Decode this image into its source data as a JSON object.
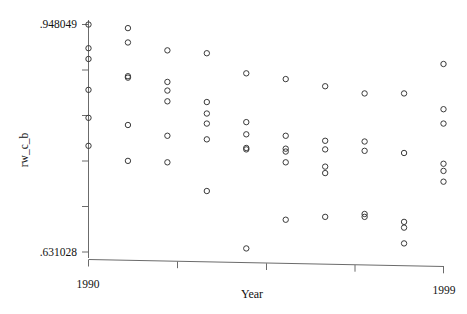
{
  "chart_data": {
    "type": "scatter",
    "title": "",
    "xlabel": "Year",
    "ylabel": "rw_c_b",
    "xlim": [
      1990,
      1999
    ],
    "ylim": [
      0.631028,
      0.948049
    ],
    "grid": false,
    "legend": null,
    "marker_style": "open-circle",
    "x_ticks": [
      {
        "value": 1990,
        "label": "1990"
      },
      {
        "value": 1993,
        "label": ""
      },
      {
        "value": 1996,
        "label": ""
      },
      {
        "value": 1999,
        "label": "1999"
      }
    ],
    "y_ticks": [
      {
        "value": 0.948049,
        "label": ".948049"
      },
      {
        "value": 0.884645,
        "label": ""
      },
      {
        "value": 0.821241,
        "label": ""
      },
      {
        "value": 0.757836,
        "label": ""
      },
      {
        "value": 0.694432,
        "label": ""
      },
      {
        "value": 0.631028,
        "label": ".631028"
      }
    ],
    "y_min_label": ".631028",
    "y_max_label": ".948049",
    "x_min_label": "1990",
    "x_max_label": "1999",
    "points": [
      {
        "x": 1990,
        "y": 0.948
      },
      {
        "x": 1990,
        "y": 0.915
      },
      {
        "x": 1990,
        "y": 0.9
      },
      {
        "x": 1990,
        "y": 0.857
      },
      {
        "x": 1990,
        "y": 0.818
      },
      {
        "x": 1990,
        "y": 0.779
      },
      {
        "x": 1991,
        "y": 0.943
      },
      {
        "x": 1991,
        "y": 0.923
      },
      {
        "x": 1991,
        "y": 0.876
      },
      {
        "x": 1991,
        "y": 0.874
      },
      {
        "x": 1991,
        "y": 0.808
      },
      {
        "x": 1991,
        "y": 0.758
      },
      {
        "x": 1992,
        "y": 0.912
      },
      {
        "x": 1992,
        "y": 0.868
      },
      {
        "x": 1992,
        "y": 0.856
      },
      {
        "x": 1992,
        "y": 0.841
      },
      {
        "x": 1992,
        "y": 0.793
      },
      {
        "x": 1992,
        "y": 0.756
      },
      {
        "x": 1993,
        "y": 0.908
      },
      {
        "x": 1993,
        "y": 0.84
      },
      {
        "x": 1993,
        "y": 0.824
      },
      {
        "x": 1993,
        "y": 0.81
      },
      {
        "x": 1993,
        "y": 0.788
      },
      {
        "x": 1993,
        "y": 0.716
      },
      {
        "x": 1994,
        "y": 0.88
      },
      {
        "x": 1994,
        "y": 0.812
      },
      {
        "x": 1994,
        "y": 0.795
      },
      {
        "x": 1994,
        "y": 0.776
      },
      {
        "x": 1994,
        "y": 0.774
      },
      {
        "x": 1994,
        "y": 0.636
      },
      {
        "x": 1995,
        "y": 0.872
      },
      {
        "x": 1995,
        "y": 0.793
      },
      {
        "x": 1995,
        "y": 0.775
      },
      {
        "x": 1995,
        "y": 0.771
      },
      {
        "x": 1995,
        "y": 0.756
      },
      {
        "x": 1995,
        "y": 0.676
      },
      {
        "x": 1996,
        "y": 0.862
      },
      {
        "x": 1996,
        "y": 0.786
      },
      {
        "x": 1996,
        "y": 0.774
      },
      {
        "x": 1996,
        "y": 0.75
      },
      {
        "x": 1996,
        "y": 0.741
      },
      {
        "x": 1996,
        "y": 0.68
      },
      {
        "x": 1997,
        "y": 0.852
      },
      {
        "x": 1997,
        "y": 0.785
      },
      {
        "x": 1997,
        "y": 0.772
      },
      {
        "x": 1997,
        "y": 0.684
      },
      {
        "x": 1997,
        "y": 0.68
      },
      {
        "x": 1998,
        "y": 0.852
      },
      {
        "x": 1998,
        "y": 0.769
      },
      {
        "x": 1998,
        "y": 0.673
      },
      {
        "x": 1998,
        "y": 0.665
      },
      {
        "x": 1998,
        "y": 0.643
      },
      {
        "x": 1999,
        "y": 0.893
      },
      {
        "x": 1999,
        "y": 0.83
      },
      {
        "x": 1999,
        "y": 0.81
      },
      {
        "x": 1999,
        "y": 0.754
      },
      {
        "x": 1999,
        "y": 0.744
      },
      {
        "x": 1999,
        "y": 0.729
      }
    ]
  }
}
